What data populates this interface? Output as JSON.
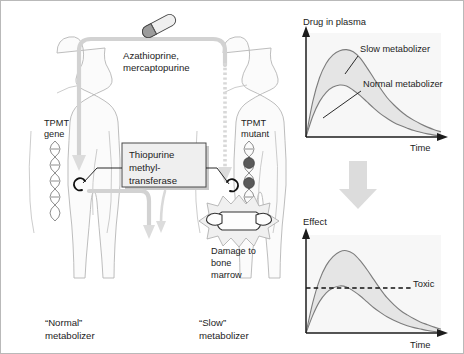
{
  "figure": {
    "title_implied": "TPMT pharmacogenetics: normal vs slow metabolizer",
    "drug_label_line1": "Azathioprine,",
    "drug_label_line2": "mercaptopurine",
    "enzyme_box": {
      "line1": "Thiopurine",
      "line2": "methyl-",
      "line3": "transferase"
    },
    "left_subject": {
      "gene_label_line1": "TPMT",
      "gene_label_line2": "gene",
      "footer_line1": "“Normal”",
      "footer_line2": "metabolizer"
    },
    "right_subject": {
      "gene_label_line1": "TPMT",
      "gene_label_line2": "mutant",
      "damage_line1": "Damage to",
      "damage_line2": "bone",
      "damage_line3": "marrow",
      "footer_line1": "“Slow”",
      "footer_line2": "metabolizer"
    },
    "icons": {
      "pill": "capsule-icon",
      "dna": "dna-helix-icon",
      "mutation": "mutation-marker-icon",
      "bone": "vertebra-bone-icon",
      "burst": "starburst-damage-icon",
      "flow_arrow": "downward-flow-arrow-icon",
      "link_arrow": "panel-link-arrow-icon"
    },
    "colors": {
      "body_fill": "#fbfbfb",
      "body_stroke": "#b6b6b6",
      "gray_flow": "#d2d2d2",
      "curve_band": "#e4e4e4",
      "curve_stroke": "#7d7d7d",
      "axis": "#1c1c1c",
      "mutation": "#5a5a5a",
      "enzyme_box_fill": "#efefef",
      "plot_bg": "#f7f7f7"
    }
  },
  "chart_data": [
    {
      "type": "line",
      "id": "drug-in-plasma-chart",
      "title": "",
      "ylabel": "Drug in plasma",
      "xlabel": "Time",
      "grid": false,
      "legend": "inline-annotations",
      "axis_ticks": false,
      "xlim": [
        0,
        10
      ],
      "ylim": [
        0,
        10
      ],
      "annotations": [
        {
          "text": "Slow metabolizer",
          "points_to_series": "Slow metabolizer"
        },
        {
          "text": "Normal metabolizer",
          "points_to_series": "Normal metabolizer"
        }
      ],
      "x": [
        0,
        0.5,
        1,
        1.5,
        2,
        2.5,
        3,
        3.5,
        4,
        4.5,
        5,
        5.5,
        6,
        6.5,
        7,
        7.5,
        8,
        8.5,
        9,
        9.5,
        10
      ],
      "series": [
        {
          "name": "Slow metabolizer",
          "values": [
            0,
            3.4,
            5.7,
            7.1,
            7.9,
            8.3,
            8.4,
            8.2,
            7.6,
            6.7,
            5.7,
            4.7,
            3.8,
            3.1,
            2.5,
            2.0,
            1.6,
            1.25,
            0.95,
            0.7,
            0.5
          ]
        },
        {
          "name": "Normal metabolizer",
          "values": [
            0,
            2.0,
            3.4,
            4.3,
            4.8,
            5.0,
            4.9,
            4.5,
            4.0,
            3.4,
            2.8,
            2.25,
            1.8,
            1.4,
            1.1,
            0.85,
            0.62,
            0.45,
            0.3,
            0.18,
            0.08
          ]
        }
      ]
    },
    {
      "type": "line",
      "id": "effect-chart",
      "title": "",
      "ylabel": "Effect",
      "xlabel": "Time",
      "grid": false,
      "legend": "none",
      "axis_ticks": false,
      "xlim": [
        0,
        10
      ],
      "ylim": [
        0,
        10
      ],
      "threshold": {
        "label": "Toxic",
        "value": 4.6,
        "style": "dashed"
      },
      "x": [
        0,
        0.5,
        1,
        1.5,
        2,
        2.5,
        3,
        3.5,
        4,
        4.5,
        5,
        5.5,
        6,
        6.5,
        7,
        7.5,
        8,
        8.5,
        9,
        9.5,
        10
      ],
      "series": [
        {
          "name": "Slow metabolizer",
          "values": [
            0,
            3.1,
            5.4,
            6.9,
            7.8,
            8.3,
            8.4,
            8.1,
            7.4,
            6.5,
            5.5,
            4.5,
            3.6,
            2.9,
            2.3,
            1.85,
            1.45,
            1.1,
            0.85,
            0.6,
            0.4
          ]
        },
        {
          "name": "Normal metabolizer",
          "values": [
            0,
            1.8,
            3.2,
            4.1,
            4.6,
            4.8,
            4.7,
            4.3,
            3.8,
            3.2,
            2.6,
            2.1,
            1.65,
            1.3,
            1.0,
            0.75,
            0.55,
            0.4,
            0.26,
            0.15,
            0.06
          ]
        }
      ]
    }
  ]
}
